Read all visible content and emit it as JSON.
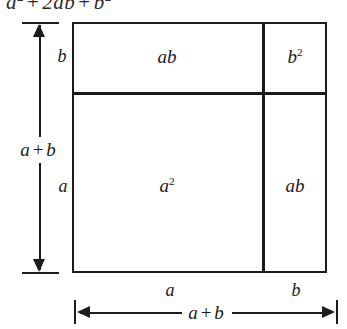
{
  "figure": {
    "type": "geometric-area-diagram",
    "formula": {
      "visible_text": "a² + 2ab + b²",
      "base_a": "a",
      "exp_2": "2",
      "plus": "+",
      "middle_term": "2ab",
      "base_b": "b"
    },
    "square": {
      "outer_side_label": "a + b",
      "cells": [
        {
          "id": "top-left",
          "label": "ab",
          "base": "ab",
          "exponent": "",
          "width_label": "a",
          "height_label": "b"
        },
        {
          "id": "top-right",
          "label": "b²",
          "base": "b",
          "exponent": "2",
          "width_label": "b",
          "height_label": "b"
        },
        {
          "id": "bottom-left",
          "label": "a²",
          "base": "a",
          "exponent": "2",
          "width_label": "a",
          "height_label": "a"
        },
        {
          "id": "bottom-right",
          "label": "ab",
          "base": "ab",
          "exponent": "",
          "width_label": "b",
          "height_label": "a"
        }
      ]
    },
    "left_side": {
      "upper_segment_label": "b",
      "lower_segment_label": "a",
      "total_label_a": "a",
      "total_label_op": "+",
      "total_label_b": "b",
      "total_label": "a + b"
    },
    "bottom_side": {
      "left_segment_label": "a",
      "right_segment_label": "b",
      "total_label_a": "a",
      "total_label_op": "+",
      "total_label_b": "b",
      "total_label": "a + b"
    },
    "colors": {
      "stroke": "#1c1c1c",
      "text": "#1a1a1a",
      "background": "#ffffff"
    }
  }
}
